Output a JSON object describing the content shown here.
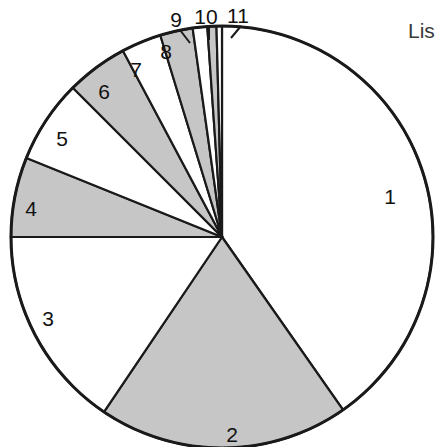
{
  "figure": {
    "background_color": "#ffffff",
    "outline_color": "#1a1a1a",
    "fill_gray": "#c6c6c6",
    "fill_white": "#ffffff",
    "clipped_caption": "Lis"
  },
  "chart_data": {
    "type": "pie",
    "title": "",
    "xlabel": "",
    "ylabel": "",
    "legend": "none",
    "grid": false,
    "start_angle_deg": 0,
    "direction": "clockwise",
    "center_px": [
      222,
      237
    ],
    "radius_px": 211,
    "categories": [
      "1",
      "2",
      "3",
      "4",
      "5",
      "6",
      "7",
      "8",
      "9",
      "10",
      "11"
    ],
    "values": [
      40.3,
      19.2,
      15.6,
      6.1,
      6.4,
      4.7,
      3.1,
      2.5,
      1.1,
      0.7,
      0.3
    ],
    "angles_deg": [
      145.0,
      69.0,
      56.0,
      22.0,
      23.0,
      17.0,
      11.0,
      9.0,
      4.0,
      2.5,
      1.5
    ],
    "slice_fills": [
      "white",
      "gray",
      "white",
      "gray",
      "white",
      "gray",
      "white",
      "gray",
      "white",
      "gray",
      "white"
    ],
    "labels": [
      {
        "text": "1",
        "x": 390,
        "y": 196,
        "leader": false
      },
      {
        "text": "2",
        "x": 232,
        "y": 434,
        "leader": false
      },
      {
        "text": "3",
        "x": 48,
        "y": 318,
        "leader": false
      },
      {
        "text": "4",
        "x": 31,
        "y": 208,
        "leader": false
      },
      {
        "text": "5",
        "x": 62,
        "y": 138,
        "leader": false
      },
      {
        "text": "6",
        "x": 104,
        "y": 91,
        "leader": false
      },
      {
        "text": "7",
        "x": 136,
        "y": 69,
        "leader": false
      },
      {
        "text": "8",
        "x": 166,
        "y": 51,
        "leader": false
      },
      {
        "text": "9",
        "x": 176,
        "y": 19,
        "leader": true
      },
      {
        "text": "10",
        "x": 206,
        "y": 16,
        "leader": true
      },
      {
        "text": "11",
        "x": 238,
        "y": 15,
        "leader": true
      }
    ],
    "leader_lines": [
      {
        "label": "9",
        "x1": 180,
        "y1": 30,
        "x2": 190,
        "y2": 43
      },
      {
        "label": "10",
        "x1": 209,
        "y1": 27,
        "x2": 209,
        "y2": 40
      },
      {
        "label": "11",
        "x1": 241,
        "y1": 26,
        "x2": 231,
        "y2": 38
      }
    ]
  },
  "side_caption": {
    "text": "Lis",
    "x": 408,
    "y": 20
  }
}
